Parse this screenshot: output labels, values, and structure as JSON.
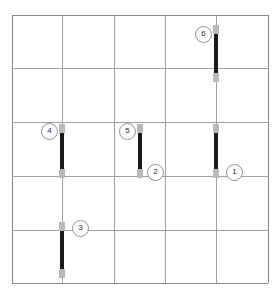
{
  "puzzle": {
    "title": "Grid with numbered vertical bars",
    "type": "diagram",
    "background_color": "#ffffff",
    "grid": {
      "rows": 5,
      "columns": 5,
      "line_color": "#a0a0a0",
      "border_color": "#8a8a8a",
      "left": 12,
      "top": 15,
      "right": 268,
      "bottom": 283,
      "x_positions": [
        12,
        62,
        114,
        165,
        216,
        268
      ],
      "y_positions": [
        15,
        68,
        122,
        176,
        230,
        283
      ]
    },
    "bar_style": {
      "core_color": "#1a1a1a",
      "cap_color": "#b9b9b9",
      "width": 4
    },
    "badge_style": {
      "border_color": "#8f8f8f",
      "fill_color": "#ffffff",
      "text_color": "#2b2b2b",
      "diameter": 15
    },
    "bars": [
      {
        "id": "bar-6",
        "x": 216,
        "y_top": 25,
        "y_bottom": 82
      },
      {
        "id": "bar-1",
        "x": 216,
        "y_top": 124,
        "y_bottom": 178
      },
      {
        "id": "bar-4",
        "x": 62,
        "y_top": 124,
        "y_bottom": 178
      },
      {
        "id": "bar-5-2",
        "x": 140,
        "y_top": 124,
        "y_bottom": 178
      },
      {
        "id": "bar-3",
        "x": 62,
        "y_top": 222,
        "y_bottom": 278
      }
    ],
    "markers": [
      {
        "label": "6",
        "x": 195,
        "y": 26
      },
      {
        "label": "4",
        "x": 41,
        "y": 123
      },
      {
        "label": "5",
        "x": 119,
        "y": 123
      },
      {
        "label": "2",
        "x": 147,
        "y": 164
      },
      {
        "label": "1",
        "x": 226,
        "y": 164
      },
      {
        "label": "3",
        "x": 72,
        "y": 220
      }
    ]
  }
}
